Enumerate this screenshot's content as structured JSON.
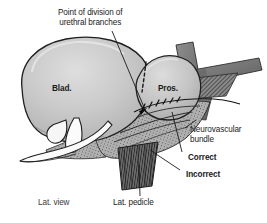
{
  "figure": {
    "type": "medical-anatomical-illustration",
    "view": "lateral",
    "background_color": "#ffffff",
    "outline_color": "#1a1a1a",
    "organ_fill_color": "#c2c2c2",
    "organ_highlight_color": "#dcdcdc",
    "band_fill_color": "#808080",
    "band_dark_color": "#5a5a5a",
    "fascia_color": "#9a9a9a",
    "pedicle_color": "#4a4a4a",
    "vessel_color": "#fbfbfb",
    "text_color": "#1a1a1a"
  },
  "labels": {
    "title_callout": {
      "line1": "Point of division of",
      "line2": "urethral branches",
      "weight": "regular"
    },
    "bladder": {
      "text": "Blad.",
      "weight": "bold"
    },
    "prostate": {
      "text": "Pros.",
      "weight": "bold"
    },
    "neurovascular_bundle": {
      "line1": "Neurovascular",
      "line2": "bundle",
      "weight": "regular"
    },
    "correct": {
      "text": "Correct",
      "weight": "bold"
    },
    "incorrect": {
      "text": "Incorrect",
      "weight": "bold"
    },
    "lateral_pedicle": {
      "text": "Lat. pedicle",
      "weight": "regular"
    },
    "lateral_view": {
      "text": "Lat. view",
      "weight": "regular"
    }
  }
}
